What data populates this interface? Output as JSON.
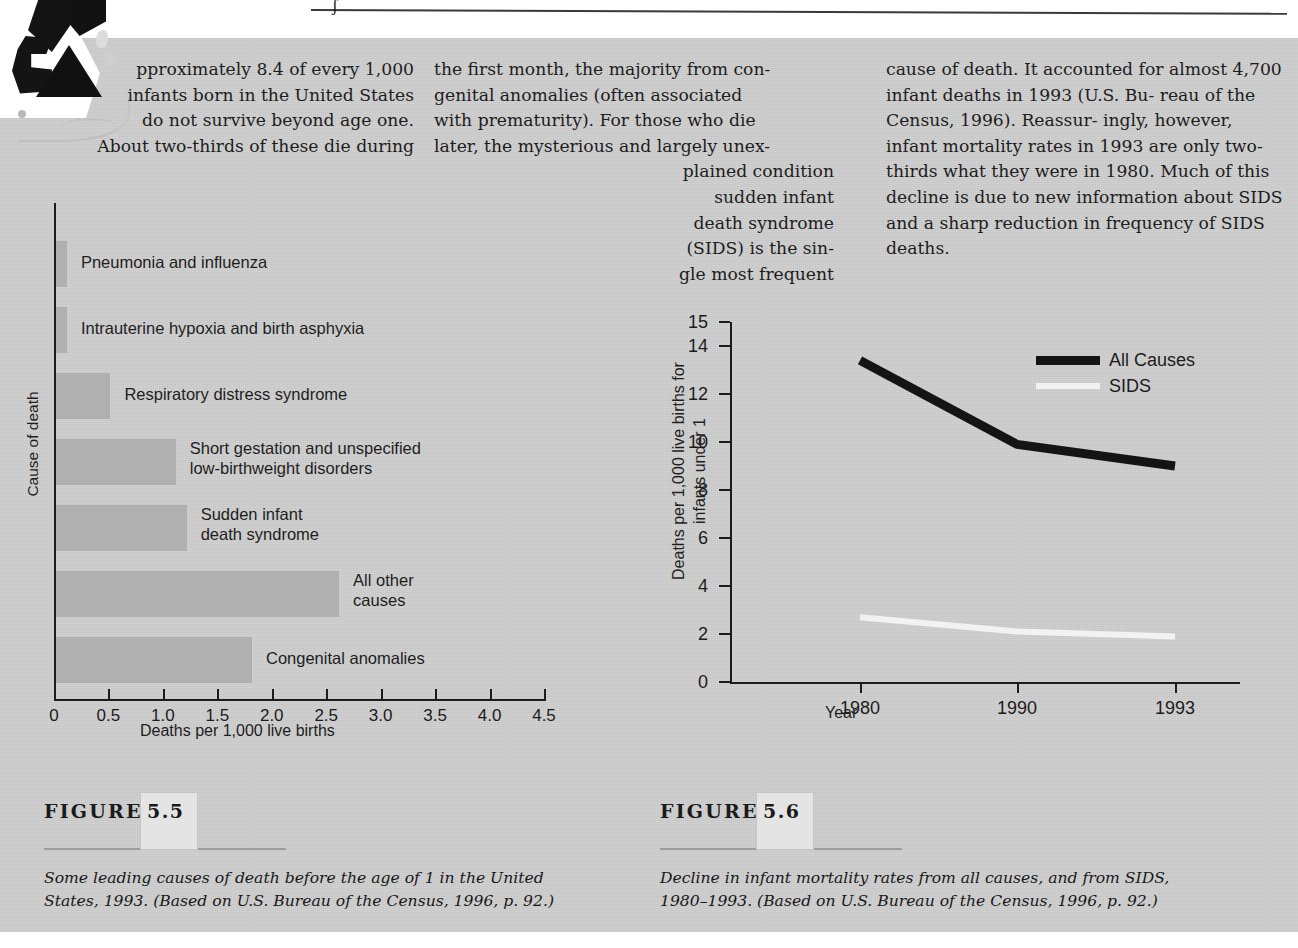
{
  "page": {
    "background_color": "#cecece",
    "top_rule_mark": "ʃ"
  },
  "body_text": {
    "column1": {
      "dropcap": "A",
      "lines": [
        "pproximately 8.4 of every 1,000",
        "infants born in the United States",
        "do not survive beyond age one.",
        "About two-thirds of these die during"
      ]
    },
    "column2": {
      "lines": [
        "the first month, the majority from con-",
        "genital anomalies (often associated",
        "with prematurity). For those who die",
        "later, the mysterious and largely unex-"
      ],
      "indented_lines": [
        "plained condition",
        "sudden infant",
        "death syndrome",
        "(SIDS) is the sin-",
        "gle most frequent"
      ]
    },
    "column3": {
      "lines": [
        "cause of death. It accounted for almost",
        "4,700 infant deaths in 1993 (U.S. Bu-",
        "reau of the Census, 1996). Reassur-",
        "ingly, however, infant mortality rates",
        "in 1993 are only two-thirds what they",
        "were in 1980. Much of this decline is",
        "due to new information about SIDS",
        "and a sharp reduction in frequency of",
        "SIDS deaths."
      ]
    }
  },
  "figure_5_5": {
    "tag_word": "FIGURE",
    "tag_number": "5.5",
    "caption": "Some leading causes of death before the age of 1 in the United States, 1993. (Based on U.S. Bureau of the Census, 1996, p. 92.)"
  },
  "figure_5_6": {
    "tag_word": "FIGURE",
    "tag_number": "5.6",
    "caption": "Decline in infant mortality rates from all causes, and from SIDS, 1980–1993. (Based on U.S. Bureau of the Census, 1996, p. 92.)"
  },
  "chart_data": [
    {
      "type": "bar",
      "id": "figure-5-5-bar-chart",
      "orientation": "horizontal",
      "title": "",
      "xlabel": "Deaths per 1,000 live births",
      "ylabel": "Cause of death",
      "xlim": [
        0,
        4.5
      ],
      "xticks": [
        "0",
        "0.5",
        "1.0",
        "1.5",
        "2.0",
        "2.5",
        "3.0",
        "3.5",
        "4.0",
        "4.5"
      ],
      "xtick_values": [
        0,
        0.5,
        1.0,
        1.5,
        2.0,
        2.5,
        3.0,
        3.5,
        4.0,
        4.5
      ],
      "grid": false,
      "bar_color": "#b0b0b0",
      "categories": [
        "Pneumonia and influenza",
        "Intrauterine hypoxia and birth asphyxia",
        "Respiratory distress syndrome",
        "Short gestation and unspecified low-birthweight disorders",
        "Sudden infant death syndrome",
        "All other causes",
        "Congenital anomalies"
      ],
      "category_labels": [
        [
          "Pneumonia and influenza"
        ],
        [
          "Intrauterine hypoxia and birth asphyxia"
        ],
        [
          "Respiratory distress syndrome"
        ],
        [
          "Short gestation and unspecified",
          "low-birthweight disorders"
        ],
        [
          "Sudden infant",
          "death syndrome"
        ],
        [
          "All other",
          "causes"
        ],
        [
          "Congenital anomalies"
        ]
      ],
      "values": [
        0.1,
        0.1,
        0.5,
        1.1,
        1.2,
        2.6,
        1.8
      ]
    },
    {
      "type": "line",
      "id": "figure-5-6-line-chart",
      "title": "",
      "xlabel": "Year",
      "ylabel": "Deaths per 1,000 live births for infants under 1",
      "ylabel_lines": [
        "Deaths per 1,000 live births for",
        "infants under 1"
      ],
      "x": [
        "1980",
        "1990",
        "1993"
      ],
      "xticks": [
        "1980",
        "1990",
        "1993"
      ],
      "yticks": [
        "0",
        "2",
        "4",
        "6",
        "8",
        "10",
        "12",
        "14",
        "15"
      ],
      "ytick_values": [
        0,
        2,
        4,
        6,
        8,
        10,
        12,
        14,
        15
      ],
      "ylim": [
        0,
        15
      ],
      "grid": false,
      "legend_position": "top-right",
      "series": [
        {
          "name": "All Causes",
          "values": [
            13.4,
            9.9,
            9.0
          ],
          "color": "#141414"
        },
        {
          "name": "SIDS",
          "values": [
            2.7,
            2.1,
            1.9
          ],
          "color": "#f2f2f2"
        }
      ]
    }
  ]
}
